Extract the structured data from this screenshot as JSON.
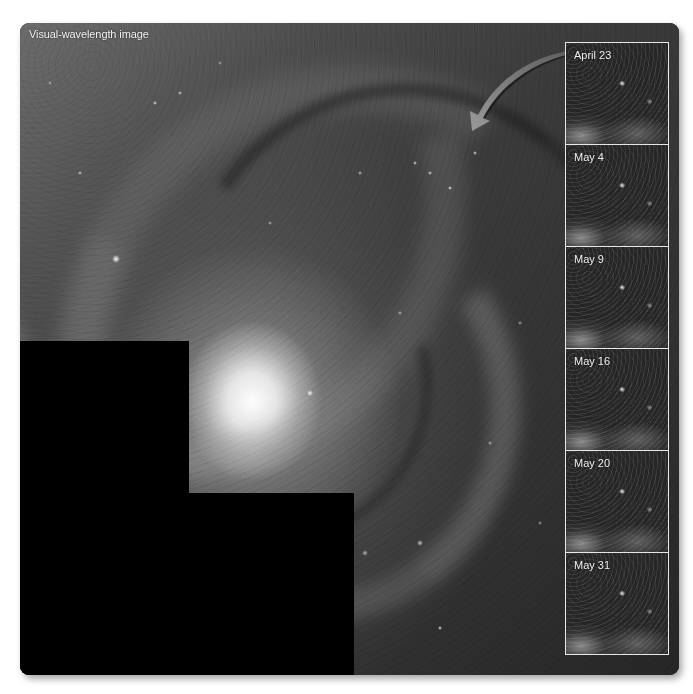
{
  "figure": {
    "main_label": "Visual-wavelength image",
    "colors": {
      "background": "#ffffff",
      "mask": "#000000",
      "label_text": "#f2f2f2",
      "inset_border": "#e8e8e8",
      "arrow_fill": "#8c8c8c"
    }
  },
  "arrow": {
    "icon": "curved-arrow-icon",
    "direction": "from inset column toward region in galaxy"
  },
  "insets": [
    {
      "label": "April 23"
    },
    {
      "label": "May 4"
    },
    {
      "label": "May 9"
    },
    {
      "label": "May 16"
    },
    {
      "label": "May 20"
    },
    {
      "label": "May 31"
    }
  ]
}
